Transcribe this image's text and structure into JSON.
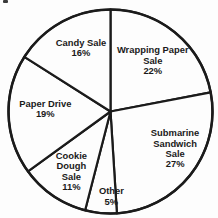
{
  "page": {
    "background_color": "#fdfdfd"
  },
  "chart_data": {
    "type": "pie",
    "title": "",
    "start_angle_deg": -90,
    "direction": "clockwise",
    "stroke_color": "#1b1b1b",
    "slice_fill": "#fdfdfd",
    "text_color": "#1a1a1a",
    "legend_position": "none",
    "slices": [
      {
        "label": "Wrapping Paper Sale",
        "value": 22,
        "display_lines": [
          "Wrapping Paper",
          "Sale",
          "22%"
        ]
      },
      {
        "label": "Submarine Sandwich Sale",
        "value": 27,
        "display_lines": [
          "Submarine",
          "Sandwich",
          "Sale",
          "27%"
        ]
      },
      {
        "label": "Other",
        "value": 5,
        "display_lines": [
          "Other",
          "5%"
        ]
      },
      {
        "label": "Cookie Dough Sale",
        "value": 11,
        "display_lines": [
          "Cookie",
          "Dough",
          "Sale",
          "11%"
        ]
      },
      {
        "label": "Paper Drive",
        "value": 19,
        "display_lines": [
          "Paper Drive",
          "19%"
        ]
      },
      {
        "label": "Candy Sale",
        "value": 16,
        "display_lines": [
          "Candy Sale",
          "16%"
        ]
      }
    ]
  }
}
